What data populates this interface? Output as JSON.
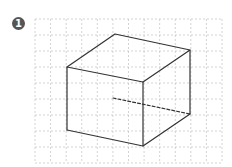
{
  "figure": {
    "badge_number": "1"
  },
  "colors": {
    "badge": "#555555",
    "grid": "#c8c8c8",
    "edge": "#333333"
  }
}
